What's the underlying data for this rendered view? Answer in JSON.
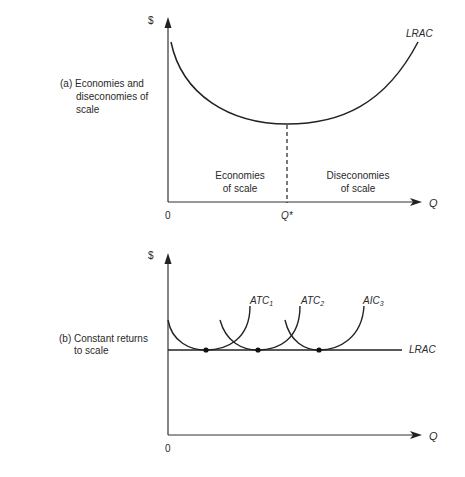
{
  "panel_a": {
    "caption_line1": "(a) Economies and",
    "caption_line2": "diseconomies of",
    "caption_line3": "scale",
    "y_axis_label": "$",
    "x_axis_label": "Q",
    "origin_label": "0",
    "qstar_label": "Q*",
    "curve_label": "LRAC",
    "region_left_line1": "Economies",
    "region_left_line2": "of scale",
    "region_right_line1": "Diseconomies",
    "region_right_line2": "of scale"
  },
  "panel_b": {
    "caption_line1": "(b) Constant returns",
    "caption_line2": "to scale",
    "y_axis_label": "$",
    "x_axis_label": "Q",
    "origin_label": "0",
    "lrac_label": "LRAC",
    "atc": [
      {
        "base": "ATC",
        "sub": "1"
      },
      {
        "base": "ATC",
        "sub": "2"
      },
      {
        "base": "AIC",
        "sub": "3"
      }
    ]
  },
  "colors": {
    "line": "#222222",
    "text": "#2a2a2a",
    "background": "#ffffff"
  }
}
